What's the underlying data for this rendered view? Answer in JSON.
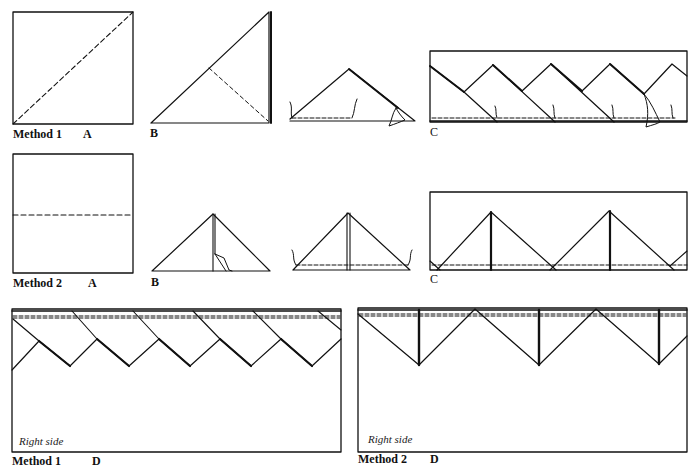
{
  "diagram": {
    "ink_color": "#111111",
    "background": "#ffffff"
  },
  "method1": {
    "label": "Method 1",
    "steps": {
      "A": "A",
      "B": "B",
      "C": "C",
      "D": "D"
    },
    "right_side": "Right side"
  },
  "method2": {
    "label": "Method 2",
    "steps": {
      "A": "A",
      "B": "B",
      "C": "C",
      "D": "D"
    },
    "right_side": "Right side"
  }
}
